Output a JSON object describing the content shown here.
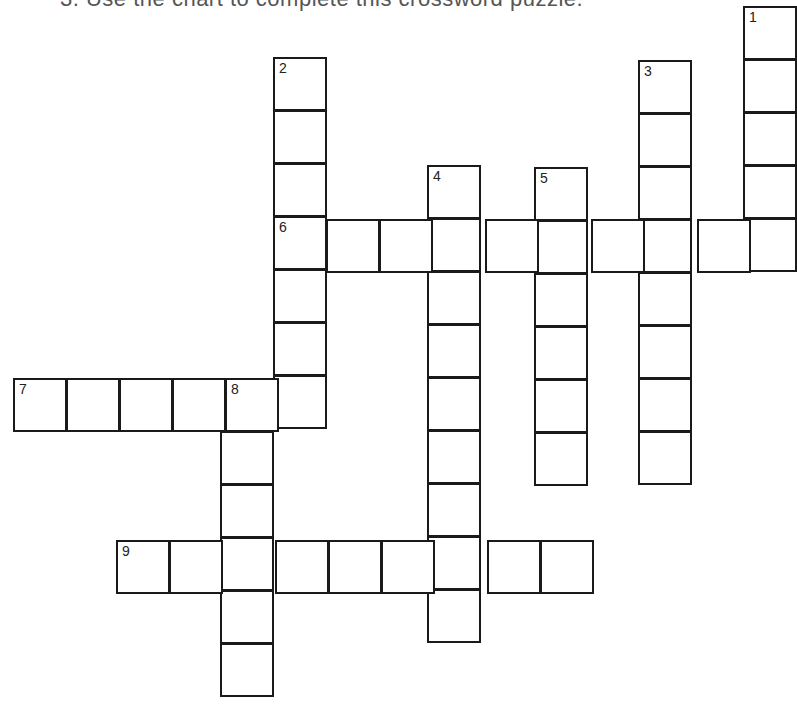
{
  "page": {
    "top_text_clipped": "3. Use the chart to complete this crossword puzzle.",
    "background": "#ffffff",
    "line_color": "#1a1a1a"
  },
  "crossword": {
    "clue_numbers": [
      "1",
      "2",
      "3",
      "4",
      "5",
      "6",
      "7",
      "8",
      "9"
    ],
    "entries": [
      {
        "number": "1",
        "direction": "down",
        "length": 5,
        "x": 743,
        "y": 6
      },
      {
        "number": "2",
        "direction": "down",
        "length": 7,
        "x": 273,
        "y": 57
      },
      {
        "number": "3",
        "direction": "down",
        "length": 8,
        "x": 638,
        "y": 60
      },
      {
        "number": "4",
        "direction": "down",
        "length": 9,
        "x": 427,
        "y": 165
      },
      {
        "number": "5",
        "direction": "down",
        "length": 6,
        "x": 534,
        "y": 167
      },
      {
        "number": "6",
        "direction": "across",
        "length": 10,
        "x": 273,
        "y": 219
      },
      {
        "number": "7",
        "direction": "across",
        "length": 6,
        "x": 13,
        "y": 378
      },
      {
        "number": "8",
        "direction": "down",
        "length": 6,
        "x": 220,
        "y": 378
      },
      {
        "number": "9",
        "direction": "across",
        "length": 9,
        "x": 116,
        "y": 540
      }
    ],
    "cell_size": 53
  }
}
